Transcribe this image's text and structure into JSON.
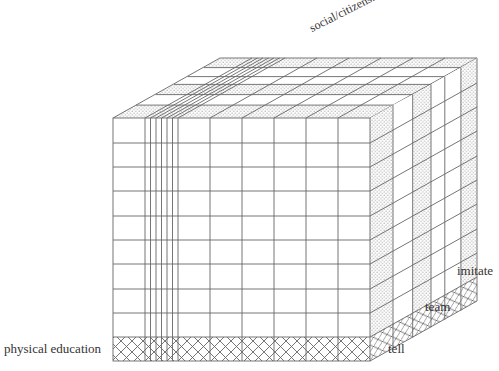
{
  "diagram": {
    "type": "3d-grid-cube",
    "labels": {
      "front_axis": "physical education",
      "top_axis": "social/citizenship",
      "right_axis_items": [
        "tell",
        "team",
        "imitate"
      ]
    },
    "front_face": {
      "rows": 10,
      "white_rows": 9,
      "crosshatch_rows": 1,
      "major_columns": 8,
      "dense_subcolumns_in_column_2": 6
    },
    "right_face": {
      "depth_slices": [
        "dotted",
        "white",
        "dotted",
        "white",
        "white",
        "dotted"
      ]
    },
    "colors": {
      "line": "#666666",
      "dot": "#9a9a9a",
      "text": "#333333"
    }
  }
}
